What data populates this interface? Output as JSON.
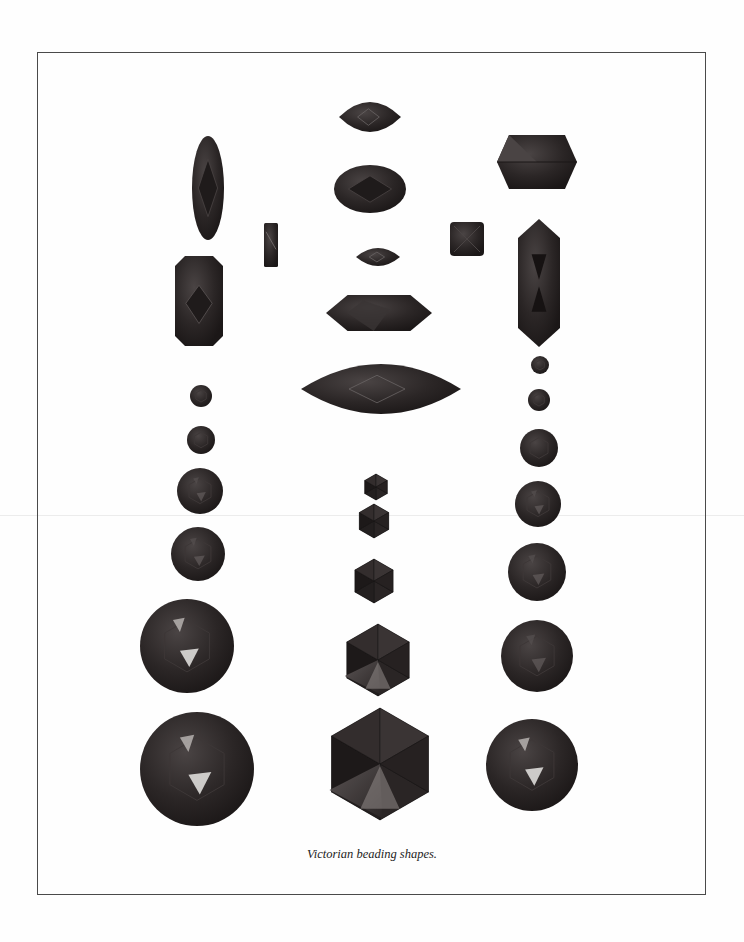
{
  "figure": {
    "caption": "Victorian beading shapes.",
    "frame": {
      "x": 37,
      "y": 52,
      "w": 669,
      "h": 843
    },
    "colors": {
      "bead": "#2b2626",
      "bead_dark": "#1b1717",
      "facet_light": "#4a4444",
      "highlight": "#e8e6e4",
      "frame": "#4a4a4a"
    }
  },
  "beads": [
    {
      "id": "left-oval-long",
      "shape": "ellipse",
      "cx": 208,
      "cy": 188,
      "rx": 16,
      "ry": 52
    },
    {
      "id": "left-rect",
      "shape": "octagon-rect",
      "cx": 199,
      "cy": 301,
      "w": 48,
      "h": 90,
      "cut": 10
    },
    {
      "id": "left-small-rect",
      "shape": "rect",
      "cx": 271,
      "cy": 245,
      "w": 14,
      "h": 44
    },
    {
      "id": "left-circle-1",
      "shape": "circle",
      "cx": 201,
      "cy": 396,
      "r": 11
    },
    {
      "id": "left-circle-2",
      "shape": "circle",
      "cx": 201,
      "cy": 440,
      "r": 14
    },
    {
      "id": "left-circle-3",
      "shape": "circle",
      "cx": 200,
      "cy": 491,
      "r": 23
    },
    {
      "id": "left-circle-4",
      "shape": "circle",
      "cx": 198,
      "cy": 554,
      "r": 27
    },
    {
      "id": "left-circle-5",
      "shape": "circle",
      "cx": 187,
      "cy": 646,
      "r": 47
    },
    {
      "id": "left-circle-6",
      "shape": "circle",
      "cx": 197,
      "cy": 769,
      "r": 57
    },
    {
      "id": "center-navette-small",
      "shape": "navette",
      "cx": 370,
      "cy": 117,
      "w": 62,
      "h": 30
    },
    {
      "id": "center-oval",
      "shape": "ellipse",
      "cx": 370,
      "cy": 189,
      "rx": 36,
      "ry": 24
    },
    {
      "id": "center-navette-tiny",
      "shape": "navette",
      "cx": 378,
      "cy": 257,
      "w": 44,
      "h": 18
    },
    {
      "id": "center-hexlong",
      "shape": "hexlong",
      "cx": 379,
      "cy": 313,
      "w": 106,
      "h": 36
    },
    {
      "id": "center-navette-large",
      "shape": "navette",
      "cx": 381,
      "cy": 389,
      "w": 160,
      "h": 50
    },
    {
      "id": "center-hex-1",
      "shape": "hexagon",
      "cx": 376,
      "cy": 487,
      "r": 13
    },
    {
      "id": "center-hex-2",
      "shape": "hexagon",
      "cx": 374,
      "cy": 521,
      "r": 17
    },
    {
      "id": "center-hex-3",
      "shape": "hexagon",
      "cx": 374,
      "cy": 581,
      "r": 22
    },
    {
      "id": "center-hex-4",
      "shape": "hexagon",
      "cx": 378,
      "cy": 660,
      "r": 36
    },
    {
      "id": "center-hex-5",
      "shape": "hexagon",
      "cx": 380,
      "cy": 764,
      "r": 56
    },
    {
      "id": "right-square",
      "shape": "square",
      "cx": 467,
      "cy": 239,
      "w": 34,
      "h": 34
    },
    {
      "id": "right-hexwide",
      "shape": "hexwide",
      "cx": 537,
      "cy": 162,
      "w": 80,
      "h": 54
    },
    {
      "id": "right-long",
      "shape": "longhex",
      "cx": 539,
      "cy": 283,
      "w": 42,
      "h": 128
    },
    {
      "id": "right-circle-1",
      "shape": "circle",
      "cx": 540,
      "cy": 365,
      "r": 9
    },
    {
      "id": "right-circle-2",
      "shape": "circle",
      "cx": 539,
      "cy": 400,
      "r": 11
    },
    {
      "id": "right-circle-3",
      "shape": "circle",
      "cx": 539,
      "cy": 448,
      "r": 19
    },
    {
      "id": "right-circle-4",
      "shape": "circle",
      "cx": 538,
      "cy": 504,
      "r": 23
    },
    {
      "id": "right-circle-5",
      "shape": "circle",
      "cx": 537,
      "cy": 572,
      "r": 29
    },
    {
      "id": "right-circle-6",
      "shape": "circle",
      "cx": 537,
      "cy": 656,
      "r": 36
    },
    {
      "id": "right-circle-7",
      "shape": "circle",
      "cx": 532,
      "cy": 765,
      "r": 46
    }
  ]
}
